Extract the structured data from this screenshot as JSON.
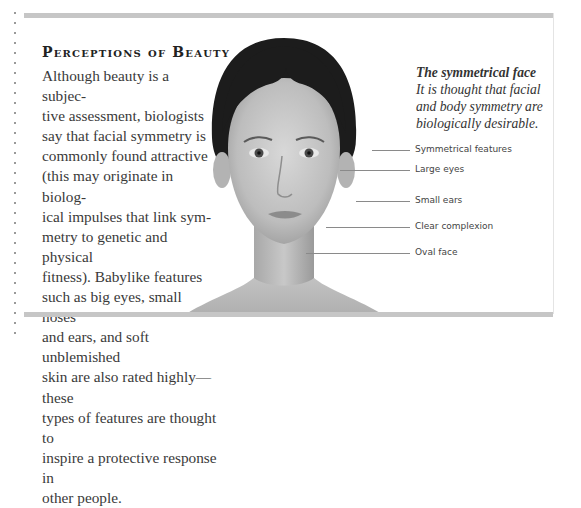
{
  "page": {
    "title": "Perceptions of Beauty",
    "body": "Although beauty is a subjec-\ntive assessment, biologists\nsay that facial symmetry is\ncommonly found attractive\n(this may originate in biolog-\nical impulses that link sym-\nmetry to genetic and physical\nfitness). Babylike features\nsuch as big eyes, small noses\nand ears, and soft unblemished\nskin are also rated highly—these\ntypes of features are thought to\ninspire a protective response in\nother people."
  },
  "sidebar": {
    "heading": "The symmetrical face",
    "caption": "It is thought that facial and body symmetry are biologically desirable."
  },
  "image": {
    "subject": "front-facing portrait of a woman, grayscale"
  },
  "annotations": [
    {
      "label": "Symmetrical features",
      "y": 144,
      "line_start": 372
    },
    {
      "label": "Large eyes",
      "y": 164,
      "line_start": 340
    },
    {
      "label": "Small ears",
      "y": 196,
      "line_start": 356
    },
    {
      "label": "Clear complexion",
      "y": 223,
      "line_start": 326
    },
    {
      "label": "Oval face",
      "y": 249,
      "line_start": 306
    }
  ],
  "colors": {
    "frame_bar": "#c6c6c6",
    "text": "#3a3a3a",
    "leader_line": "#8a8a8a"
  }
}
